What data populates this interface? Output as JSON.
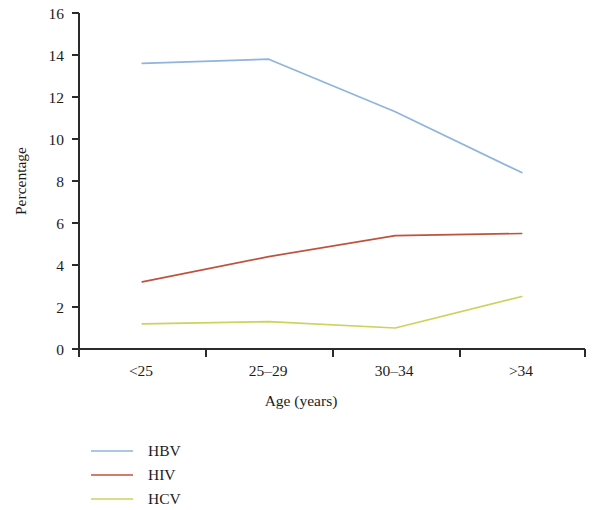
{
  "chart_data": {
    "type": "line",
    "title": "",
    "xlabel": "Age (years)",
    "ylabel": "Percentage",
    "categories": [
      "<25",
      "25–29",
      "30–34",
      ">34"
    ],
    "ylim": [
      0,
      16
    ],
    "yticks": [
      0,
      2,
      4,
      6,
      8,
      10,
      12,
      14,
      16
    ],
    "ytick_labels": [
      "0",
      "2",
      "4",
      "6",
      "8",
      "10",
      "12",
      "14",
      "16"
    ],
    "grid": false,
    "legend_position": "below-left",
    "series": [
      {
        "name": "HBV",
        "color": "#8fb4dd",
        "values": [
          13.6,
          13.8,
          11.3,
          8.4
        ]
      },
      {
        "name": "HIV",
        "color": "#c0523d",
        "values": [
          3.2,
          4.4,
          5.4,
          5.5
        ]
      },
      {
        "name": "HCV",
        "color": "#cdd25c",
        "values": [
          1.2,
          1.3,
          1.0,
          2.5
        ]
      }
    ]
  },
  "axes": {
    "y_title": "Percentage",
    "x_title": "Age (years)",
    "y_tick_0": "0",
    "y_tick_1": "2",
    "y_tick_2": "4",
    "y_tick_3": "6",
    "y_tick_4": "8",
    "y_tick_5": "10",
    "y_tick_6": "12",
    "y_tick_7": "14",
    "y_tick_8": "16",
    "x_tick_0": "<25",
    "x_tick_1": "25–29",
    "x_tick_2": "30–34",
    "x_tick_3": ">34"
  },
  "legend": {
    "items": [
      {
        "label": "HBV",
        "color": "#8fb4dd"
      },
      {
        "label": "HIV",
        "color": "#c0523d"
      },
      {
        "label": "HCV",
        "color": "#cdd25c"
      }
    ]
  }
}
